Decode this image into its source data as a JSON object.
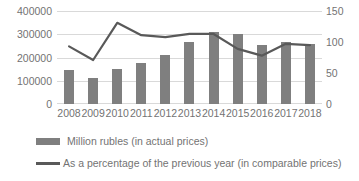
{
  "chart_data": {
    "type": "bar",
    "title": "",
    "subtitle": "",
    "xlabel": "",
    "ylabel": "",
    "categories": [
      "2008",
      "2009",
      "2010",
      "2011",
      "2012",
      "2013",
      "2014",
      "2015",
      "2016",
      "2017",
      "2018"
    ],
    "grid": true,
    "legend_position": "bottom-left",
    "axes": {
      "left": {
        "label": "",
        "ylim": [
          0,
          400000
        ],
        "ticks": [
          0,
          100000,
          200000,
          300000,
          400000
        ],
        "tick_labels": [
          "0",
          "100000",
          "200000",
          "300000",
          "400000"
        ]
      },
      "right": {
        "label": "",
        "ylim": [
          0,
          150
        ],
        "ticks": [
          0,
          50,
          100,
          150
        ],
        "tick_labels": [
          "0",
          "50",
          "100",
          "150"
        ]
      }
    },
    "series": [
      {
        "name": "Million rubles (in actual prices)",
        "type": "bar",
        "axis": "left",
        "color": "#7f7f7f",
        "values": [
          146000,
          112000,
          150000,
          176000,
          210000,
          268000,
          310000,
          302000,
          252000,
          266000,
          258000
        ]
      },
      {
        "name": "As a percentage of the previous year (in comparable prices)",
        "type": "line",
        "axis": "right",
        "color": "#595959",
        "values": [
          93,
          71,
          131,
          111,
          108,
          113,
          113,
          89,
          78,
          97,
          95
        ]
      }
    ]
  },
  "legend": {
    "items": [
      {
        "label": "Million rubles (in actual prices)",
        "marker": "bar-swatch"
      },
      {
        "label": "As a percentage of the previous year (in comparable prices)",
        "marker": "line-swatch"
      }
    ]
  }
}
